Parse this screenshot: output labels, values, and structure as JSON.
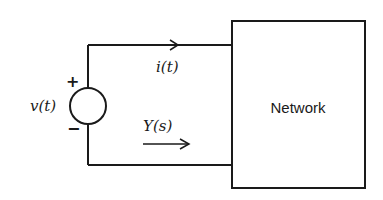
{
  "diagram": {
    "type": "circuit",
    "source": {
      "kind": "voltage-source",
      "label": "v(t)",
      "plus_sign": "+",
      "minus_sign": "−"
    },
    "current": {
      "label": "i(t)",
      "direction": "right"
    },
    "admittance": {
      "label": "Y(s)",
      "direction": "right"
    },
    "block": {
      "label": "Network"
    },
    "colors": {
      "stroke": "#1a1a1a",
      "background": "#ffffff"
    }
  }
}
